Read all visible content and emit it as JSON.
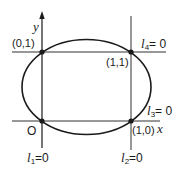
{
  "diagram": {
    "axes": {
      "x_label": "x",
      "y_label": "y",
      "origin_label": "O"
    },
    "points": [
      {
        "label": "(0,1)",
        "x": 0,
        "y": 1
      },
      {
        "label": "(1,1)",
        "x": 1,
        "y": 1
      },
      {
        "label": "(0,0)",
        "x": 0,
        "y": 0
      },
      {
        "label": "(1,0)",
        "x": 1,
        "y": 0
      }
    ],
    "lines": [
      {
        "name": "l1",
        "base": "l",
        "sub": "1",
        "rest": "=0",
        "orientation": "vertical",
        "at": "x=0"
      },
      {
        "name": "l2",
        "base": "l",
        "sub": "2",
        "rest": "=0",
        "orientation": "vertical",
        "at": "x=1"
      },
      {
        "name": "l3",
        "base": "l",
        "sub": "3",
        "rest": "= 0",
        "orientation": "horizontal",
        "at": "y=0"
      },
      {
        "name": "l4",
        "base": "l",
        "sub": "4",
        "rest": "= 0",
        "orientation": "horizontal",
        "at": "y=1"
      }
    ],
    "curve": {
      "type": "ellipse",
      "passes_through": [
        "(0,0)",
        "(1,0)",
        "(0,1)",
        "(1,1)"
      ]
    },
    "colors": {
      "stroke": "#1a1a1a",
      "background": "#ffffff"
    }
  }
}
